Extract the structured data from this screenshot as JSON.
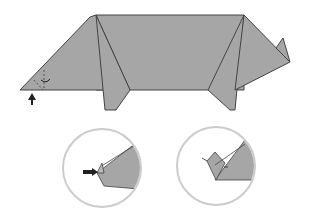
{
  "diagram": {
    "colors": {
      "paper": "#a6a6a6",
      "stroke": "#444444",
      "circle": "#cccccc",
      "arrow": "#222222"
    },
    "views": [
      "main-pig",
      "detail-snout-push",
      "detail-snout-result"
    ]
  }
}
